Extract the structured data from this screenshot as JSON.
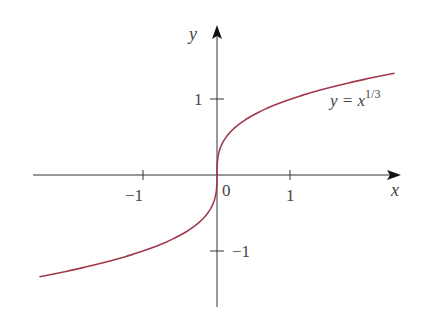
{
  "chart_data": {
    "type": "line",
    "title": "",
    "xlabel": "x",
    "ylabel": "y",
    "x_ticks": [
      -1,
      1
    ],
    "x_tick_labels": [
      "−1",
      "1"
    ],
    "y_ticks": [
      1,
      -1
    ],
    "y_tick_labels": [
      "1",
      "−1"
    ],
    "origin_label": "0",
    "xlim": [
      -2.4,
      2.4
    ],
    "ylim": [
      -1.7,
      2.0
    ],
    "grid": false,
    "legend": "none",
    "series": [
      {
        "name": "y = x^(1/3)",
        "label_main": "y = x",
        "label_exp": "1/3",
        "function": "cbrt",
        "x_range": [
          -2.4,
          2.4
        ],
        "color": "#a03a4a"
      }
    ]
  },
  "colors": {
    "axis": "#333333",
    "curve": "#a03a4a",
    "text": "#444444"
  }
}
